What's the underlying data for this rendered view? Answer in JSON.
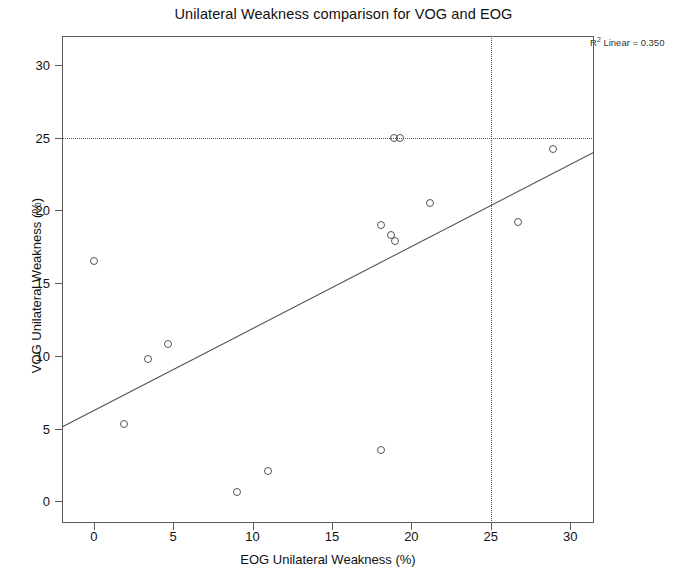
{
  "chart_data": {
    "type": "scatter",
    "title": "Unilateral Weakness comparison for VOG and EOG",
    "xlabel": "EOG Unilateral Weakness (%)",
    "ylabel": "VOG Unilateral Weakness (%)",
    "xlim": [
      -2,
      31.5
    ],
    "ylim": [
      -1.5,
      32
    ],
    "xticks": [
      0,
      5,
      10,
      15,
      20,
      25,
      30
    ],
    "yticks": [
      0,
      5,
      10,
      15,
      20,
      25,
      30
    ],
    "xtick_labels": [
      "0",
      "5",
      "10",
      "15",
      "20",
      "25",
      "30"
    ],
    "ytick_labels": [
      "0",
      "5",
      "10",
      "15",
      "20",
      "25",
      "30"
    ],
    "grid": false,
    "legend": null,
    "annotation": "R² Linear = 0.350",
    "annotation_parts": {
      "prefix": "R",
      "sup": "2",
      "suffix": " Linear = 0.350"
    },
    "r_squared": 0.35,
    "marker_style": "open-circle",
    "marker_color": "#555555",
    "line_color": "#555555",
    "points": [
      {
        "x": 0.0,
        "y": 16.5
      },
      {
        "x": 1.9,
        "y": 5.3
      },
      {
        "x": 3.4,
        "y": 9.8
      },
      {
        "x": 4.7,
        "y": 10.8
      },
      {
        "x": 9.0,
        "y": 0.6
      },
      {
        "x": 11.0,
        "y": 2.1
      },
      {
        "x": 18.1,
        "y": 3.5
      },
      {
        "x": 18.1,
        "y": 19.0
      },
      {
        "x": 18.7,
        "y": 18.3
      },
      {
        "x": 19.0,
        "y": 17.9
      },
      {
        "x": 18.9,
        "y": 25.0
      },
      {
        "x": 19.3,
        "y": 25.0
      },
      {
        "x": 21.2,
        "y": 20.5
      },
      {
        "x": 26.7,
        "y": 19.2
      },
      {
        "x": 28.9,
        "y": 24.2
      }
    ],
    "fit_line": {
      "x1": -2.0,
      "y1": 5.1,
      "x2": 31.5,
      "y2": 24.0
    },
    "reference_lines": [
      {
        "orientation": "horizontal",
        "value": 25,
        "style": "dotted"
      },
      {
        "orientation": "vertical",
        "value": 25,
        "style": "dotted"
      }
    ]
  }
}
